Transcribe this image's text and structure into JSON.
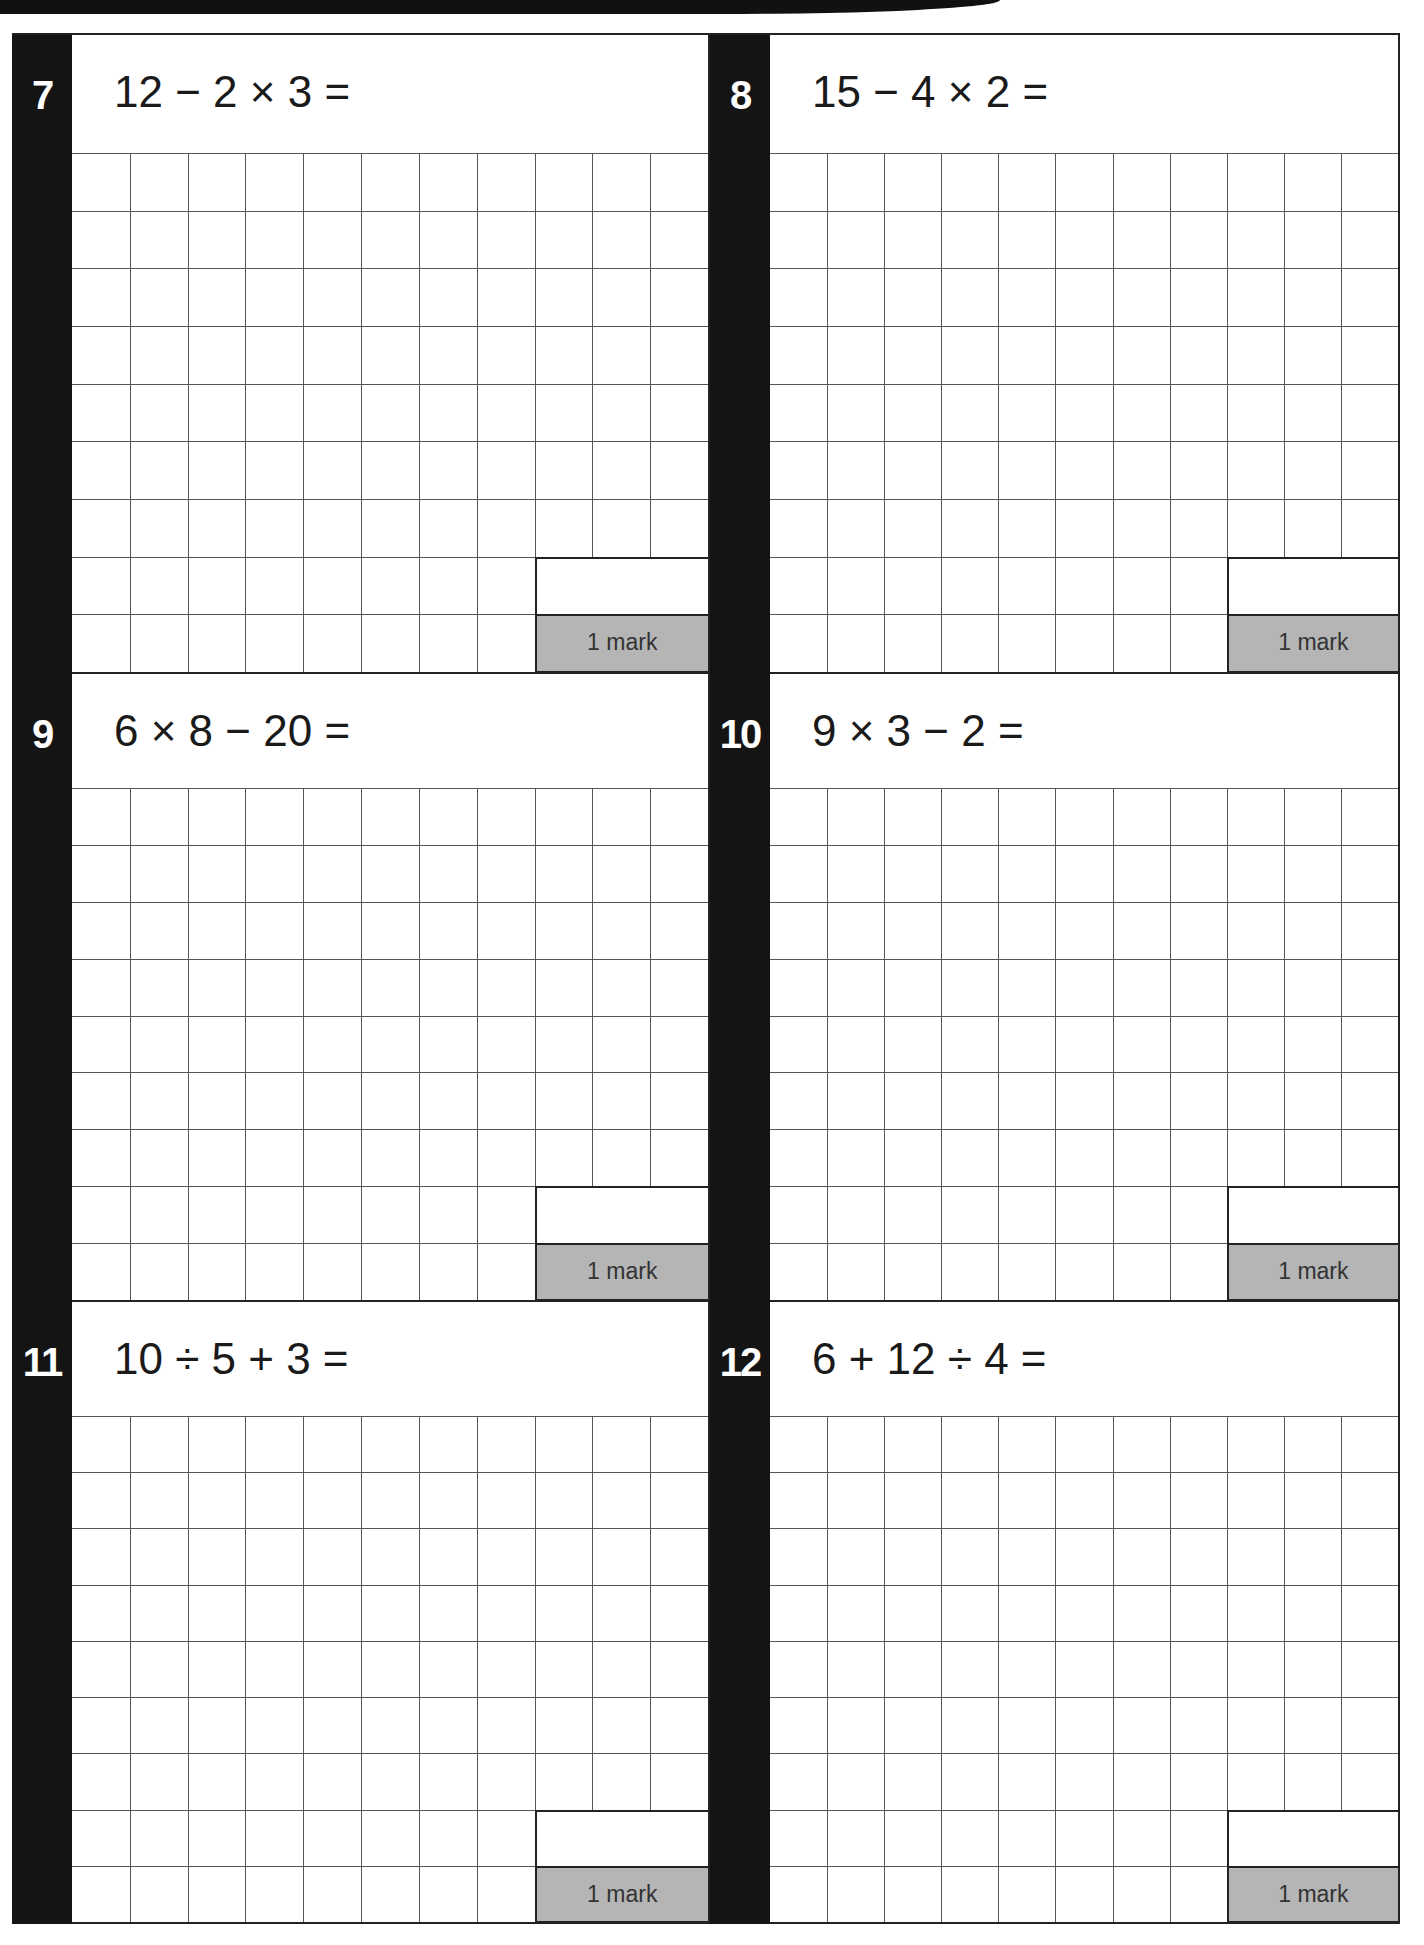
{
  "worksheet": {
    "answer_grid": {
      "columns": 11,
      "rows": 9,
      "answer_box_columns": 3,
      "answer_box_rows": 2
    },
    "colors": {
      "number_bar": "#141414",
      "mark_box": "#b5b5b5",
      "grid_line": "#555555"
    },
    "questions": [
      {
        "number": "7",
        "expression": "12 − 2 × 3 =",
        "marks": "1 mark"
      },
      {
        "number": "8",
        "expression": "15 − 4 × 2 =",
        "marks": "1 mark"
      },
      {
        "number": "9",
        "expression": "6 × 8 − 20 =",
        "marks": "1 mark"
      },
      {
        "number": "10",
        "expression": "9 × 3 − 2 =",
        "marks": "1 mark"
      },
      {
        "number": "11",
        "expression": "10 ÷ 5 + 3 =",
        "marks": "1 mark"
      },
      {
        "number": "12",
        "expression": "6 + 12 ÷ 4 =",
        "marks": "1 mark"
      }
    ]
  }
}
